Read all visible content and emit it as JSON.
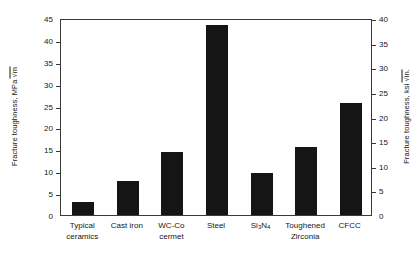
{
  "chart_data": {
    "type": "bar",
    "title": "",
    "categories": [
      "Typical\nceramics",
      "Cast iron",
      "WC-Co\ncermet",
      "Steel",
      "Si3N4",
      "Toughened\nZirconia",
      "CFCC"
    ],
    "values": [
      3.0,
      7.7,
      14.5,
      43.3,
      9.7,
      15.6,
      25.5
    ],
    "xlabel": "",
    "ylabel": "Fracture toughness, MPa √m",
    "ylabel_right": "Fracture toughness, ksi√in.",
    "ylim": [
      0,
      45
    ],
    "ylim_right": [
      0,
      40
    ],
    "yticks": [
      0,
      5,
      10,
      15,
      20,
      25,
      30,
      35,
      40,
      45
    ],
    "yticks_right": [
      0,
      5,
      10,
      15,
      20,
      25,
      30,
      35,
      40
    ],
    "grid": false,
    "legend": null,
    "bar_color": "#151515",
    "axis_color": "#3a3a3a"
  },
  "axes": {
    "left": {
      "title_prefix": "Fracture toughness, MPa",
      "title_radicand": "m",
      "ticks": [
        "0",
        "5",
        "10",
        "15",
        "20",
        "25",
        "30",
        "35",
        "40",
        "45"
      ]
    },
    "right": {
      "title_prefix": "Fracture toughness, ksi",
      "title_radicand": "in.",
      "ticks": [
        "0",
        "5",
        "10",
        "15",
        "20",
        "25",
        "30",
        "35",
        "40"
      ]
    }
  },
  "categories": [
    {
      "line1": "Typical",
      "line2": "ceramics"
    },
    {
      "line1": "Cast iron",
      "line2": ""
    },
    {
      "line1": "WC-Co",
      "line2": "cermet"
    },
    {
      "line1": "Steel",
      "line2": ""
    },
    {
      "line1": "Si3N4",
      "line2": "",
      "formula": true,
      "base1": "Si",
      "sub1": "3",
      "base2": "N",
      "sub2": "4"
    },
    {
      "line1": "Toughened",
      "line2": "Zirconia"
    },
    {
      "line1": "CFCC",
      "line2": ""
    }
  ]
}
